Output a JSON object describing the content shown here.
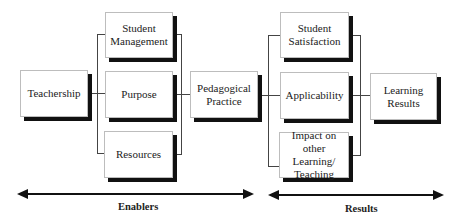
{
  "diagram": {
    "nodes": {
      "teachership": "Teachership",
      "student_management": "Student Management",
      "purpose": "Purpose",
      "resources": "Resources",
      "pedagogical_practice": "Pedagogical Practice",
      "student_satisfaction": "Student Satisfaction",
      "applicability": "Applicability",
      "impact": "Impact on other Learning/ Teaching",
      "learning_results": "Learning Results"
    },
    "sections": {
      "enablers": "Enablers",
      "results": "Results"
    },
    "edges": [
      [
        "Teachership",
        "Student Management"
      ],
      [
        "Teachership",
        "Purpose"
      ],
      [
        "Teachership",
        "Resources"
      ],
      [
        "Student Management",
        "Pedagogical Practice"
      ],
      [
        "Purpose",
        "Pedagogical Practice"
      ],
      [
        "Resources",
        "Pedagogical Practice"
      ],
      [
        "Pedagogical Practice",
        "Student Satisfaction"
      ],
      [
        "Pedagogical Practice",
        "Applicability"
      ],
      [
        "Pedagogical Practice",
        "Impact on other Learning/ Teaching"
      ],
      [
        "Student Satisfaction",
        "Learning Results"
      ],
      [
        "Applicability",
        "Learning Results"
      ],
      [
        "Impact on other Learning/ Teaching",
        "Learning Results"
      ]
    ]
  }
}
